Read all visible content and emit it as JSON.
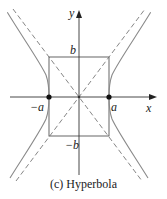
{
  "figure": {
    "caption": "(c) Hyperbola",
    "type": "hyperbola",
    "equation_form": "x^2/a^2 - y^2/b^2 = 1"
  },
  "axes": {
    "x_label": "x",
    "y_label": "y"
  },
  "labels": {
    "a_pos": "a",
    "a_neg": "−a",
    "b_pos": "b",
    "b_neg": "−b"
  },
  "elements": {
    "vertices": [
      "(-a, 0)",
      "(a, 0)"
    ],
    "reference_box": "rectangle with corners (±a, ±b)",
    "asymptotes": [
      "y = (b/a)x",
      "y = -(b/a)x"
    ],
    "asymptote_style": "dashed",
    "curve_color": "#8a8a8a",
    "axis_color": "#333333",
    "box_color": "#555555"
  }
}
